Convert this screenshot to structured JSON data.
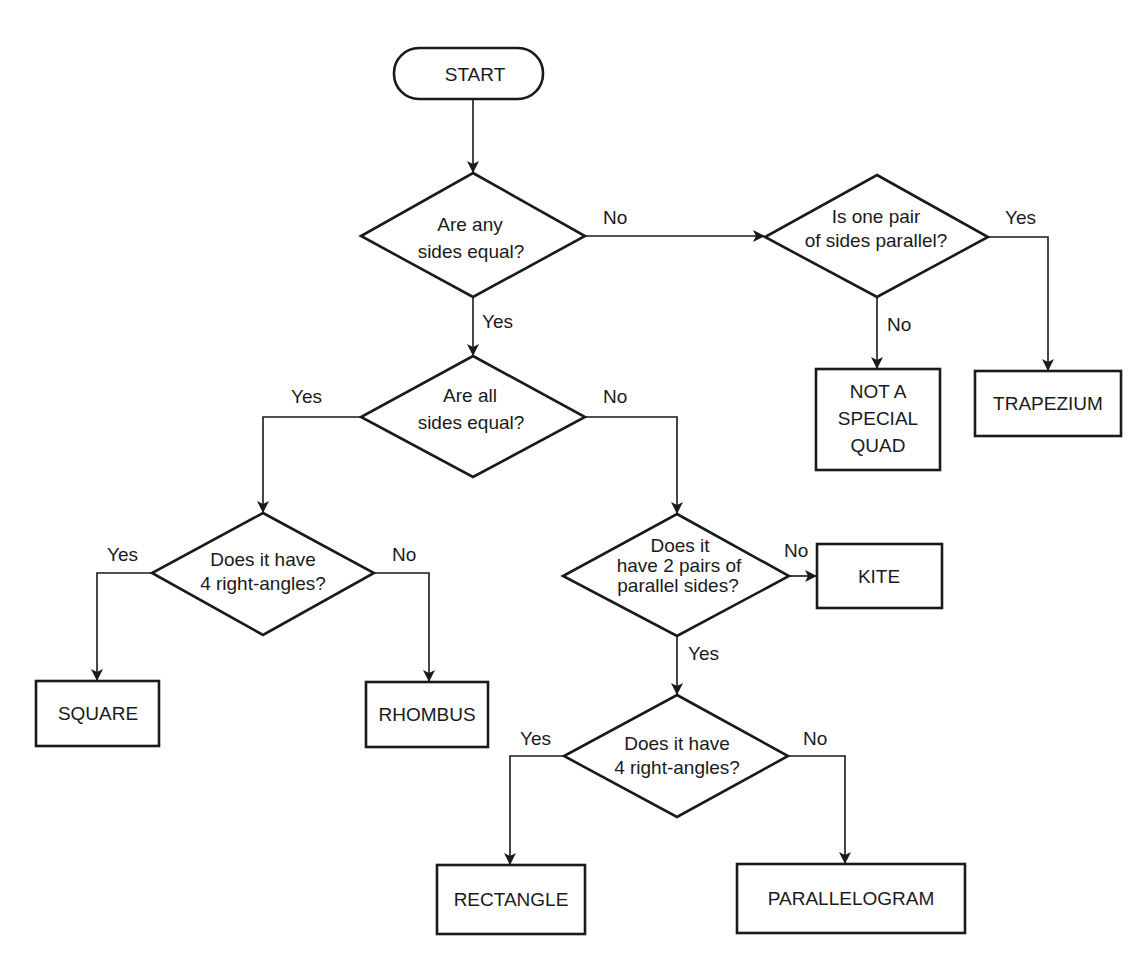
{
  "diagram": {
    "type": "flowchart",
    "nodes": {
      "start": {
        "label": "START",
        "shape": "terminal"
      },
      "q_any_equal": {
        "lines": [
          "Are any",
          "sides equal?"
        ],
        "shape": "decision"
      },
      "q_one_pair_parallel": {
        "lines": [
          "Is one pair",
          "of sides parallel?"
        ],
        "shape": "decision"
      },
      "q_all_equal": {
        "lines": [
          "Are all",
          "sides equal?"
        ],
        "shape": "decision"
      },
      "q_right_angles_1": {
        "lines": [
          "Does it have",
          "4 right-angles?"
        ],
        "shape": "decision"
      },
      "q_two_pairs_parallel": {
        "lines": [
          "Does it",
          "have 2 pairs of",
          "parallel sides?"
        ],
        "shape": "decision"
      },
      "q_right_angles_2": {
        "lines": [
          "Does it have",
          "4 right-angles?"
        ],
        "shape": "decision"
      },
      "not_special": {
        "lines": [
          "NOT A",
          "SPECIAL",
          "QUAD"
        ],
        "shape": "process"
      },
      "trapezium": {
        "label": "TRAPEZIUM",
        "shape": "process"
      },
      "square": {
        "label": "SQUARE",
        "shape": "process"
      },
      "rhombus": {
        "label": "RHOMBUS",
        "shape": "process"
      },
      "kite": {
        "label": "KITE",
        "shape": "process"
      },
      "rectangle": {
        "label": "RECTANGLE",
        "shape": "process"
      },
      "parallelogram": {
        "label": "PARALLELOGRAM",
        "shape": "process"
      }
    },
    "edges": {
      "any_equal_no": {
        "from": "q_any_equal",
        "to": "q_one_pair_parallel",
        "label": "No"
      },
      "any_equal_yes": {
        "from": "q_any_equal",
        "to": "q_all_equal",
        "label": "Yes"
      },
      "one_pair_yes": {
        "from": "q_one_pair_parallel",
        "to": "trapezium",
        "label": "Yes"
      },
      "one_pair_no": {
        "from": "q_one_pair_parallel",
        "to": "not_special",
        "label": "No"
      },
      "all_equal_yes": {
        "from": "q_all_equal",
        "to": "q_right_angles_1",
        "label": "Yes"
      },
      "all_equal_no": {
        "from": "q_all_equal",
        "to": "q_two_pairs_parallel",
        "label": "No"
      },
      "right1_yes": {
        "from": "q_right_angles_1",
        "to": "square",
        "label": "Yes"
      },
      "right1_no": {
        "from": "q_right_angles_1",
        "to": "rhombus",
        "label": "No"
      },
      "two_pairs_no": {
        "from": "q_two_pairs_parallel",
        "to": "kite",
        "label": "No"
      },
      "two_pairs_yes": {
        "from": "q_two_pairs_parallel",
        "to": "q_right_angles_2",
        "label": "Yes"
      },
      "right2_yes": {
        "from": "q_right_angles_2",
        "to": "rectangle",
        "label": "Yes"
      },
      "right2_no": {
        "from": "q_right_angles_2",
        "to": "parallelogram",
        "label": "No"
      }
    }
  }
}
